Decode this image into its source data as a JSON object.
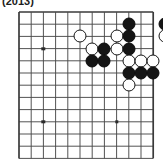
{
  "caption": {
    "text": "(2013)"
  },
  "board": {
    "name": "go-board-diagram",
    "type": "go",
    "columns": 11,
    "rows": 12,
    "origin_x": 19,
    "origin_y": 2,
    "spacing": 12.2,
    "line_color": "#4a4a4a",
    "edge_color": "#3a3a3a",
    "background": "#ffffff",
    "star_points": [
      {
        "col": 2,
        "row": 3
      },
      {
        "col": 2,
        "row": 9
      },
      {
        "col": 8,
        "row": 9
      }
    ],
    "stones": [
      {
        "color": "black",
        "col": 9,
        "row": 1
      },
      {
        "color": "black",
        "col": 12,
        "row": 1
      },
      {
        "color": "white",
        "col": 13,
        "row": 1
      },
      {
        "color": "white",
        "col": 5,
        "row": 2
      },
      {
        "color": "white",
        "col": 8,
        "row": 2
      },
      {
        "color": "black",
        "col": 9,
        "row": 2
      },
      {
        "color": "white",
        "col": 12,
        "row": 2
      },
      {
        "color": "white",
        "col": 6,
        "row": 3
      },
      {
        "color": "black",
        "col": 7,
        "row": 3
      },
      {
        "color": "white",
        "col": 8,
        "row": 3
      },
      {
        "color": "black",
        "col": 9,
        "row": 3
      },
      {
        "color": "black",
        "col": 6,
        "row": 4
      },
      {
        "color": "black",
        "col": 7,
        "row": 4
      },
      {
        "color": "white",
        "col": 9,
        "row": 4
      },
      {
        "color": "white",
        "col": 10,
        "row": 4
      },
      {
        "color": "white",
        "col": 11,
        "row": 4
      },
      {
        "color": "black",
        "col": 9,
        "row": 5
      },
      {
        "color": "black",
        "col": 10,
        "row": 5
      },
      {
        "color": "black",
        "col": 11,
        "row": 5
      },
      {
        "color": "white",
        "col": 9,
        "row": 6
      }
    ]
  }
}
